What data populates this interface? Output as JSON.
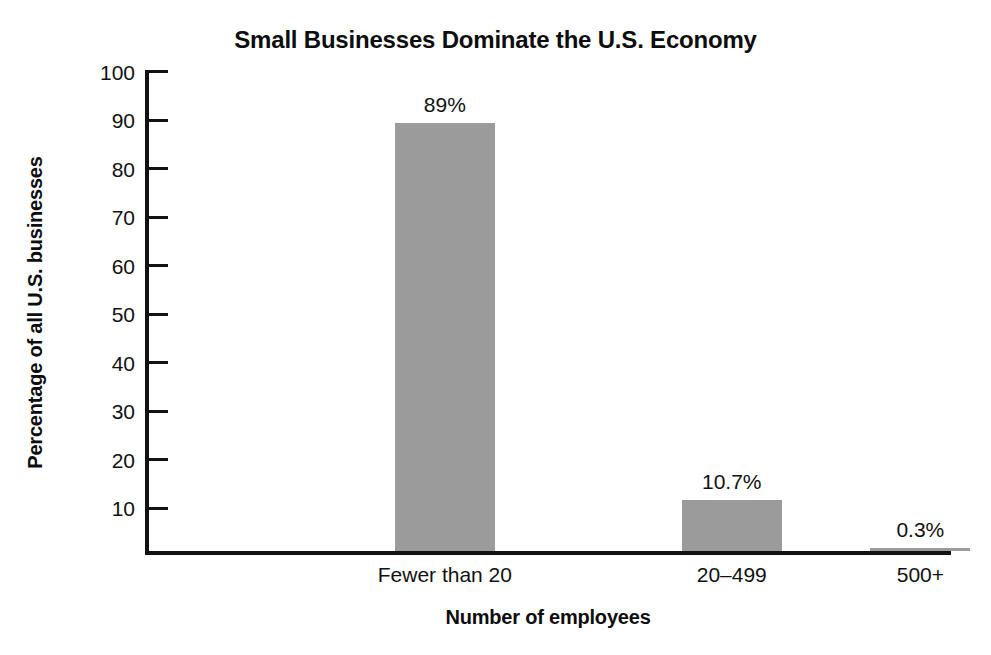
{
  "chart_data": {
    "type": "bar",
    "title": "Small Businesses Dominate the U.S. Economy",
    "xlabel": "Number of employees",
    "ylabel": "Percentage of all U.S. businesses",
    "categories": [
      "Fewer than 20",
      "20–499",
      "500+"
    ],
    "values": [
      89,
      10.7,
      0.3
    ],
    "value_labels": [
      "89%",
      "10.7%",
      "0.3%"
    ],
    "ylim": [
      0,
      100
    ],
    "yticks": [
      100,
      90,
      80,
      70,
      60,
      50,
      40,
      30,
      20,
      10
    ],
    "ytick_labels": [
      "100",
      "90",
      "80",
      "70",
      "60",
      "50",
      "40",
      "30",
      "20",
      "10"
    ],
    "grid": false,
    "legend": false,
    "bar_color": "#9b9b9b",
    "axis_color": "#111111",
    "background": "#ffffff"
  }
}
